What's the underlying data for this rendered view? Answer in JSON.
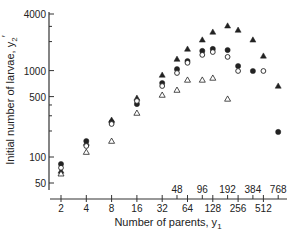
{
  "chart_data": {
    "type": "scatter",
    "title": "",
    "xlabel": "Number of parents, y",
    "xlabel_subscript": "1",
    "ylabel": "Initial number of larvae, y",
    "ylabel_subscript": "2",
    "ylabel_prime": "′",
    "xscale": "log2",
    "yscale": "log10",
    "xlim": [
      2,
      768
    ],
    "ylim": [
      50,
      4000
    ],
    "grid": false,
    "x_ticks_bottom": [
      2,
      4,
      8,
      16,
      32,
      64,
      128,
      256,
      512
    ],
    "x_ticks_bottom_labels": [
      "2",
      "4",
      "8",
      "16",
      "32",
      "64",
      "128",
      "256",
      "512"
    ],
    "x_ticks_top": [
      48,
      96,
      192,
      384,
      768
    ],
    "x_ticks_top_labels": [
      "48",
      "96",
      "192",
      "384",
      "768"
    ],
    "y_ticks": [
      50,
      100,
      500,
      1000,
      4000
    ],
    "y_tick_labels": [
      "50",
      "100",
      "500",
      "1000",
      "4000"
    ],
    "y_minor_ticks": [
      200,
      300,
      400,
      2000,
      3000
    ],
    "series": [
      {
        "name": "filled-triangle",
        "marker": "triangle-filled",
        "points": [
          [
            2,
            69
          ],
          [
            4,
            145
          ],
          [
            8,
            268
          ],
          [
            16,
            482
          ],
          [
            32,
            890
          ],
          [
            48,
            1360
          ],
          [
            64,
            1780
          ],
          [
            96,
            2270
          ],
          [
            128,
            2800
          ],
          [
            192,
            3300
          ],
          [
            256,
            2950
          ],
          [
            384,
            2270
          ],
          [
            512,
            1480
          ],
          [
            768,
            664
          ]
        ]
      },
      {
        "name": "filled-circle",
        "marker": "circle-filled",
        "points": [
          [
            2,
            83
          ],
          [
            4,
            153
          ],
          [
            8,
            254
          ],
          [
            16,
            410
          ],
          [
            32,
            718
          ],
          [
            48,
            1040
          ],
          [
            64,
            1290
          ],
          [
            96,
            1690
          ],
          [
            128,
            1780
          ],
          [
            192,
            1730
          ],
          [
            256,
            1130
          ],
          [
            384,
            990
          ],
          [
            768,
            195
          ]
        ]
      },
      {
        "name": "open-circle",
        "marker": "circle-open",
        "points": [
          [
            2,
            75
          ],
          [
            4,
            134
          ],
          [
            8,
            241
          ],
          [
            16,
            445
          ],
          [
            32,
            663
          ],
          [
            48,
            938
          ],
          [
            64,
            1230
          ],
          [
            96,
            1520
          ],
          [
            128,
            1640
          ],
          [
            192,
            1440
          ],
          [
            256,
            990
          ],
          [
            512,
            990
          ]
        ]
      },
      {
        "name": "open-triangle",
        "marker": "triangle-open",
        "points": [
          [
            2,
            64
          ],
          [
            4,
            114
          ],
          [
            8,
            153
          ],
          [
            16,
            323
          ],
          [
            32,
            522
          ],
          [
            48,
            596
          ],
          [
            64,
            780
          ],
          [
            96,
            780
          ],
          [
            128,
            822
          ],
          [
            192,
            470
          ]
        ]
      }
    ]
  }
}
